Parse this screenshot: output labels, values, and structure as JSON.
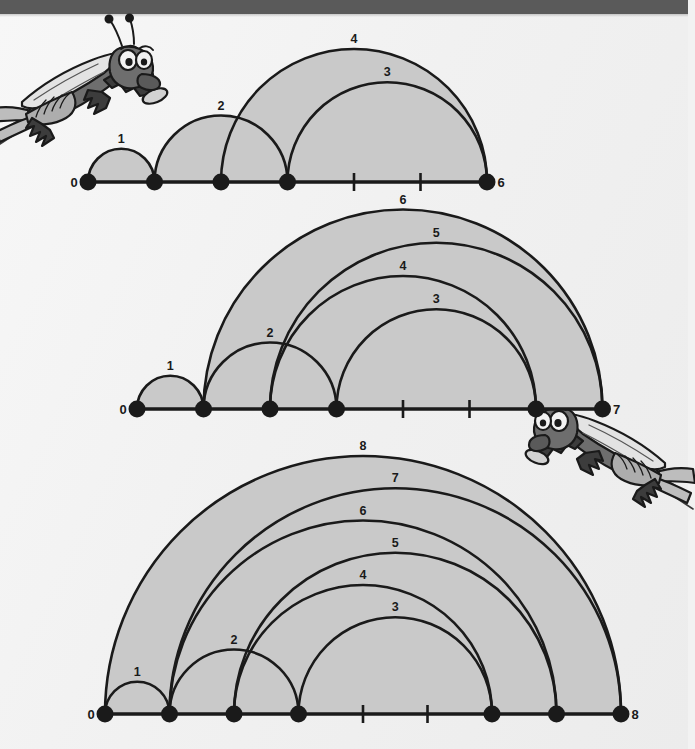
{
  "page": {
    "background_color": "#f2f2f2",
    "top_band_color": "#5a5a5a",
    "arc_fill_color": "#c9c9c9",
    "stroke_color": "#1a1a1a"
  },
  "illustrations": [
    {
      "name": "grasshopper-top-left",
      "caption": ""
    },
    {
      "name": "grasshopper-middle-right",
      "caption": ""
    }
  ],
  "chart_data": [
    {
      "type": "arc-diagram",
      "title": "",
      "index": 1,
      "axis_min": 0,
      "axis_max": 6,
      "endpoint_labels": {
        "left": "0",
        "right": "6"
      },
      "tick_labels": [
        "0",
        "1",
        "2",
        "3",
        "4",
        "5",
        "6"
      ],
      "dot_positions": [
        0,
        1,
        2,
        3,
        6
      ],
      "tick_positions": [
        4,
        5
      ],
      "arcs": [
        {
          "label": "1",
          "from": 0,
          "to": 1
        },
        {
          "label": "2",
          "from": 1,
          "to": 3
        },
        {
          "label": "3",
          "from": 3,
          "to": 6
        },
        {
          "label": "4",
          "from": 2,
          "to": 6
        }
      ]
    },
    {
      "type": "arc-diagram",
      "title": "",
      "index": 2,
      "axis_min": 0,
      "axis_max": 7,
      "endpoint_labels": {
        "left": "0",
        "right": "7"
      },
      "tick_labels": [
        "0",
        "1",
        "2",
        "3",
        "4",
        "5",
        "6",
        "7"
      ],
      "dot_positions": [
        0,
        1,
        2,
        3,
        6,
        7
      ],
      "tick_positions": [
        4,
        5
      ],
      "arcs": [
        {
          "label": "1",
          "from": 0,
          "to": 1
        },
        {
          "label": "2",
          "from": 1,
          "to": 3
        },
        {
          "label": "3",
          "from": 3,
          "to": 6
        },
        {
          "label": "4",
          "from": 2,
          "to": 6
        },
        {
          "label": "5",
          "from": 2,
          "to": 7
        },
        {
          "label": "6",
          "from": 1,
          "to": 7
        }
      ]
    },
    {
      "type": "arc-diagram",
      "title": "",
      "index": 3,
      "axis_min": 0,
      "axis_max": 8,
      "endpoint_labels": {
        "left": "0",
        "right": "8"
      },
      "tick_labels": [
        "0",
        "1",
        "2",
        "3",
        "4",
        "5",
        "6",
        "7",
        "8"
      ],
      "dot_positions": [
        0,
        1,
        2,
        3,
        6,
        7,
        8
      ],
      "tick_positions": [
        4,
        5
      ],
      "arcs": [
        {
          "label": "1",
          "from": 0,
          "to": 1
        },
        {
          "label": "2",
          "from": 1,
          "to": 3
        },
        {
          "label": "3",
          "from": 3,
          "to": 6
        },
        {
          "label": "4",
          "from": 2,
          "to": 6
        },
        {
          "label": "5",
          "from": 2,
          "to": 7
        },
        {
          "label": "6",
          "from": 1,
          "to": 7
        },
        {
          "label": "7",
          "from": 1,
          "to": 8
        },
        {
          "label": "8",
          "from": 0,
          "to": 8
        }
      ]
    }
  ],
  "layout": [
    {
      "left": 88,
      "baseline_y": 182,
      "step": 66.5,
      "svg_top": 20,
      "svg_height": 180
    },
    {
      "left": 137,
      "baseline_y": 409,
      "step": 66.5,
      "svg_top": 200,
      "svg_height": 225
    },
    {
      "left": 105,
      "baseline_y": 714,
      "step": 64.5,
      "svg_top": 430,
      "svg_height": 305
    }
  ]
}
